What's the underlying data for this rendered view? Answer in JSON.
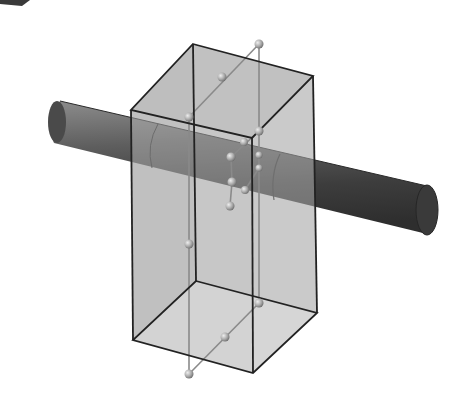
{
  "figure": {
    "colors": {
      "background": "#ffffff",
      "box_face": "#bdbdbd",
      "box_face_light": "#e3e3e3",
      "box_edge": "#222222",
      "cylinder_dark": "#3a3a3a",
      "cylinder_mid": "#6a6a6a",
      "cylinder_light": "#8c8c8c",
      "guide_line": "#8a8a8a",
      "sphere": "#b0b0b0"
    },
    "box": {
      "top": [
        [
          193,
          44
        ],
        [
          313,
          76
        ],
        [
          252,
          138
        ],
        [
          131,
          110
        ]
      ],
      "bottom": [
        [
          196,
          281
        ],
        [
          317,
          313
        ],
        [
          253,
          373
        ],
        [
          133,
          340
        ]
      ]
    },
    "cylinder": {
      "left_end": [
        57,
        122
      ],
      "right_end": [
        427,
        210
      ],
      "radius": 22
    },
    "spheres": [
      [
        259,
        44
      ],
      [
        222,
        77
      ],
      [
        189,
        117
      ],
      [
        259,
        131
      ],
      [
        244,
        142
      ],
      [
        231,
        157
      ],
      [
        259,
        155
      ],
      [
        232,
        182
      ],
      [
        259,
        168
      ],
      [
        245,
        190
      ],
      [
        230,
        206
      ],
      [
        189,
        244
      ],
      [
        259,
        303
      ],
      [
        225,
        337
      ],
      [
        189,
        374
      ]
    ],
    "corner_fragment": "partial dark shape at top-left edge"
  }
}
